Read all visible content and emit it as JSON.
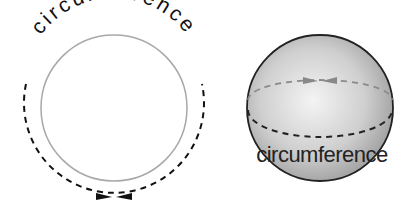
{
  "left_figure": {
    "label": "circumference",
    "description": "flat circle with dashed circumference arrow"
  },
  "right_figure": {
    "label": "circumference",
    "description": "shaded sphere with dashed equator circumference"
  },
  "colors": {
    "circle_stroke": "#a0a0a0",
    "dash": "#111111",
    "sphere_outline": "#222222",
    "sphere_fill_light": "#f2f2f2",
    "sphere_fill_dark": "#9a9a9a",
    "back_dash": "#8a8a8a"
  }
}
